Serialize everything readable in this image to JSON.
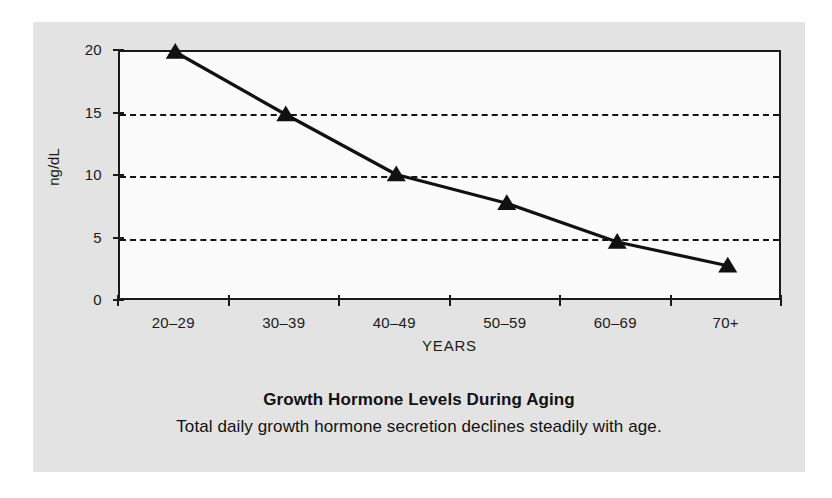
{
  "caption": {
    "title": "Growth Hormone Levels During Aging",
    "subtitle": "Total daily growth hormone secretion declines steadily with age."
  },
  "colors": {
    "panel_background": "#e3e3e3",
    "plot_background": "#fbfbfb",
    "axis": "#1a1a1a",
    "series_line": "#111111",
    "gridline": "#141414"
  },
  "chart_data": {
    "type": "line",
    "title": "Growth Hormone Levels During Aging",
    "subtitle": "Total daily growth hormone secretion declines steadily with age.",
    "xlabel": "YEARS",
    "ylabel": "ng/dL",
    "categories": [
      "20–29",
      "30–39",
      "40–49",
      "50–59",
      "60–69",
      "70+"
    ],
    "values": [
      20,
      15,
      10.2,
      7.9,
      4.8,
      2.9
    ],
    "yticks": [
      0,
      5,
      10,
      15,
      20
    ],
    "ylim": [
      0,
      20
    ],
    "gridlines": [
      5,
      10,
      15
    ],
    "grid": true,
    "legend": null,
    "marker": "triangle"
  }
}
